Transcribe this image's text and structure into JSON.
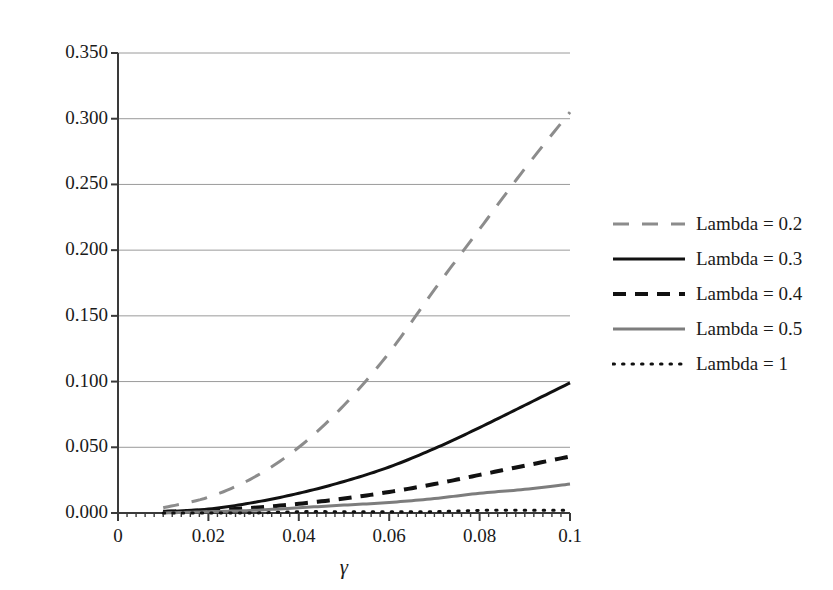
{
  "chart_data": {
    "type": "line",
    "title": "",
    "subtitle": "",
    "xlabel": "γ",
    "ylabel": "",
    "xlim": [
      0,
      0.1
    ],
    "ylim": [
      0,
      0.35
    ],
    "grid": true,
    "grid_axis": "y",
    "legend_position": "right",
    "x_ticks": [
      "0",
      "0.02",
      "0.04",
      "0.06",
      "0.08",
      "0.1"
    ],
    "x_tick_values": [
      0,
      0.02,
      0.04,
      0.06,
      0.08,
      0.1
    ],
    "y_ticks": [
      "0.000",
      "0.050",
      "0.100",
      "0.150",
      "0.200",
      "0.250",
      "0.300",
      "0.350"
    ],
    "y_tick_values": [
      0,
      0.05,
      0.1,
      0.15,
      0.2,
      0.25,
      0.3,
      0.35
    ],
    "x": [
      0.01,
      0.02,
      0.03,
      0.04,
      0.05,
      0.06,
      0.07,
      0.08,
      0.09,
      0.1
    ],
    "series": [
      {
        "name": "Lambda = 0.2",
        "style": "long-dash",
        "color": "#8c8c8c",
        "width": 3,
        "values": [
          0.004,
          0.012,
          0.027,
          0.05,
          0.082,
          0.122,
          0.17,
          0.216,
          0.262,
          0.305
        ]
      },
      {
        "name": "Lambda = 0.3",
        "style": "solid",
        "color": "#111111",
        "width": 3,
        "values": [
          0.001,
          0.003,
          0.008,
          0.015,
          0.024,
          0.035,
          0.049,
          0.065,
          0.082,
          0.099
        ]
      },
      {
        "name": "Lambda = 0.4",
        "style": "dash",
        "color": "#111111",
        "width": 4,
        "values": [
          0.001,
          0.002,
          0.004,
          0.007,
          0.011,
          0.016,
          0.022,
          0.029,
          0.036,
          0.043
        ]
      },
      {
        "name": "Lambda = 0.5",
        "style": "solid",
        "color": "#7d7d7d",
        "width": 3,
        "values": [
          0.0,
          0.001,
          0.002,
          0.004,
          0.006,
          0.008,
          0.011,
          0.015,
          0.018,
          0.022
        ]
      },
      {
        "name": "Lambda = 1",
        "style": "dot",
        "color": "#111111",
        "width": 3,
        "values": [
          0.0,
          0.0,
          0.0,
          0.001,
          0.001,
          0.001,
          0.001,
          0.002,
          0.002,
          0.002
        ]
      }
    ]
  },
  "legend": {
    "items": [
      {
        "label": "Lambda = 0.2"
      },
      {
        "label": "Lambda = 0.3"
      },
      {
        "label": "Lambda = 0.4"
      },
      {
        "label": "Lambda = 0.5"
      },
      {
        "label": "Lambda = 1"
      }
    ]
  },
  "colors": {
    "axis": "#3a3a3a",
    "grid": "#9a9a9a",
    "text": "#1a1a1a",
    "series_gray": "#8c8c8c",
    "series_black": "#111111"
  }
}
